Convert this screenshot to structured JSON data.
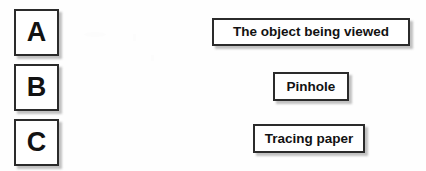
{
  "diagram": {
    "kind": "matching-exercise",
    "background_color": "#fefefe",
    "border_color": "#2b2b2b",
    "text_color": "#121212",
    "letter_tiles": [
      {
        "name": "tile-a",
        "label": "A"
      },
      {
        "name": "tile-b",
        "label": "B"
      },
      {
        "name": "tile-c",
        "label": "C"
      }
    ],
    "label_plates": [
      {
        "name": "plate-object",
        "label": "The object being viewed"
      },
      {
        "name": "plate-pinhole",
        "label": "Pinhole"
      },
      {
        "name": "plate-tracing",
        "label": "Tracing paper"
      }
    ]
  }
}
